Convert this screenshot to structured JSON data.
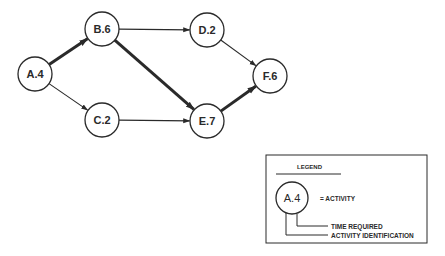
{
  "diagram": {
    "type": "activity-network",
    "nodes": [
      {
        "id": "A",
        "label": "A.4",
        "activity": "A",
        "time": 4
      },
      {
        "id": "B",
        "label": "B.6",
        "activity": "B",
        "time": 6
      },
      {
        "id": "C",
        "label": "C.2",
        "activity": "C",
        "time": 2
      },
      {
        "id": "D",
        "label": "D.2",
        "activity": "D",
        "time": 2
      },
      {
        "id": "E",
        "label": "E.7",
        "activity": "E",
        "time": 7
      },
      {
        "id": "F",
        "label": "F.6",
        "activity": "F",
        "time": 6
      }
    ],
    "edges": [
      {
        "from": "A",
        "to": "B",
        "critical": true
      },
      {
        "from": "A",
        "to": "C",
        "critical": false
      },
      {
        "from": "B",
        "to": "D",
        "critical": false
      },
      {
        "from": "B",
        "to": "E",
        "critical": true
      },
      {
        "from": "C",
        "to": "E",
        "critical": false
      },
      {
        "from": "D",
        "to": "F",
        "critical": false
      },
      {
        "from": "E",
        "to": "F",
        "critical": true
      }
    ]
  },
  "legend": {
    "title": "LEGEND",
    "example_node": "A.4",
    "activity_label": "= ACTIVITY",
    "time_label": "TIME REQUIRED",
    "id_label": "ACTIVITY IDENTIFICATION"
  },
  "colors": {
    "ink": "#2a2a2a",
    "background": "#ffffff"
  }
}
